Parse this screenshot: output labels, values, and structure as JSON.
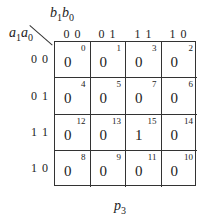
{
  "kmap": {
    "col_var": {
      "v1": "b",
      "s1": "1",
      "v2": "b",
      "s2": "0"
    },
    "row_var": {
      "v1": "a",
      "s1": "1",
      "v2": "a",
      "s2": "0"
    },
    "col_labels": [
      "0 0",
      "0 1",
      "1 1",
      "1 0"
    ],
    "row_labels": [
      "0 0",
      "0 1",
      "1 1",
      "1 0"
    ],
    "cells": [
      [
        {
          "value": "0",
          "index": "0"
        },
        {
          "value": "0",
          "index": "1"
        },
        {
          "value": "0",
          "index": "3"
        },
        {
          "value": "0",
          "index": "2"
        }
      ],
      [
        {
          "value": "0",
          "index": "4"
        },
        {
          "value": "0",
          "index": "5"
        },
        {
          "value": "0",
          "index": "7"
        },
        {
          "value": "0",
          "index": "6"
        }
      ],
      [
        {
          "value": "0",
          "index": "12"
        },
        {
          "value": "0",
          "index": "13"
        },
        {
          "value": "1",
          "index": "15"
        },
        {
          "value": "0",
          "index": "14"
        }
      ],
      [
        {
          "value": "0",
          "index": "8"
        },
        {
          "value": "0",
          "index": "9"
        },
        {
          "value": "0",
          "index": "11"
        },
        {
          "value": "0",
          "index": "10"
        }
      ]
    ],
    "output": {
      "name": "p",
      "sub": "3"
    }
  }
}
